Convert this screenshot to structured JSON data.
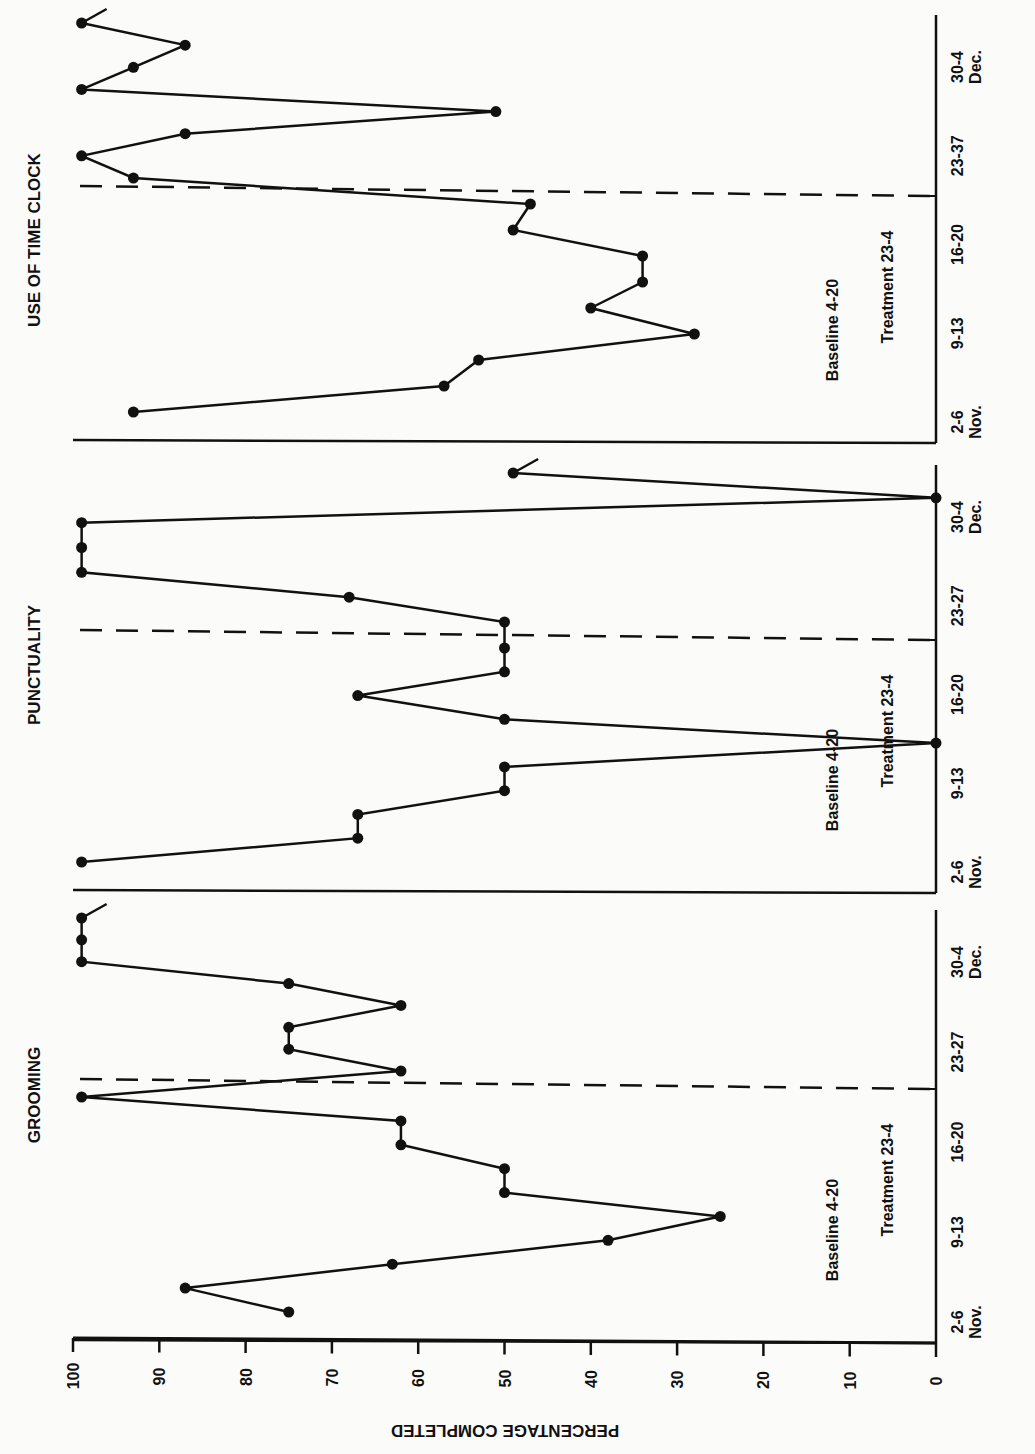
{
  "chart_data": {
    "type": "line",
    "orientation": "rotated-90-clockwise",
    "ylabel": "PERCENTAGE COMPLETED",
    "ylim": [
      0,
      100
    ],
    "yticks": [
      100,
      90,
      80,
      70,
      60,
      50,
      40,
      30,
      20,
      10,
      0
    ],
    "panels": [
      {
        "title": "USE OF TIME CLOCK",
        "xtick_labels": [
          "2-6\nNov.",
          "9-13",
          "16-20",
          "23-37",
          "30-4\nDec."
        ],
        "phase_labels": {
          "baseline": "Baseline 4-20",
          "treatment": "Treatment 23-4"
        },
        "series": [
          {
            "name": "Use of Time Clock",
            "baseline": [
              93,
              57,
              53,
              28,
              40,
              34,
              34,
              49,
              47
            ],
            "treatment": [
              93,
              99,
              87,
              51,
              99,
              93,
              87,
              99
            ]
          }
        ]
      },
      {
        "title": "PUNCTUALITY",
        "xtick_labels": [
          "2-6\nNov.",
          "9-13",
          "16-20",
          "23-27",
          "30-4\nDec."
        ],
        "phase_labels": {
          "baseline": "Baseline 4-20",
          "treatment": "Treatment 23-4"
        },
        "series": [
          {
            "name": "Punctuality",
            "baseline": [
              99,
              67,
              67,
              50,
              50,
              0,
              50,
              67,
              50,
              50
            ],
            "treatment": [
              50,
              68,
              99,
              99,
              99,
              0,
              49
            ]
          }
        ]
      },
      {
        "title": "GROOMING",
        "xtick_labels": [
          "2-6\nNov.",
          "9-13",
          "16-20",
          "23-27",
          "30-4\nDec."
        ],
        "phase_labels": {
          "baseline": "Baseline 4-20",
          "treatment": "Treatment 23-4"
        },
        "series": [
          {
            "name": "Grooming",
            "baseline": [
              75,
              87,
              63,
              38,
              25,
              50,
              50,
              62,
              62,
              99
            ],
            "treatment": [
              62,
              75,
              75,
              62,
              75,
              99,
              99,
              99
            ]
          }
        ]
      }
    ],
    "grid": false,
    "legend": null
  },
  "axis": {
    "ylabel": "PERCENTAGE COMPLETED",
    "ticks": [
      "100",
      "90",
      "80",
      "70",
      "60",
      "50",
      "40",
      "30",
      "20",
      "10",
      "0"
    ]
  },
  "panels": [
    {
      "title": "USE OF TIME CLOCK",
      "baseline_label": "Baseline 4-20",
      "treatment_label": "Treatment 23-4",
      "x_labels": [
        {
          "top": "2-6",
          "bottom": "Nov."
        },
        {
          "top": "9-13",
          "bottom": ""
        },
        {
          "top": "16-20",
          "bottom": ""
        },
        {
          "top": "23-37",
          "bottom": ""
        },
        {
          "top": "30-4",
          "bottom": "Dec."
        }
      ]
    },
    {
      "title": "PUNCTUALITY",
      "baseline_label": "Baseline 4-20",
      "treatment_label": "Treatment 23-4",
      "x_labels": [
        {
          "top": "2-6",
          "bottom": "Nov."
        },
        {
          "top": "9-13",
          "bottom": ""
        },
        {
          "top": "16-20",
          "bottom": ""
        },
        {
          "top": "23-27",
          "bottom": ""
        },
        {
          "top": "30-4",
          "bottom": "Dec."
        }
      ]
    },
    {
      "title": "GROOMING",
      "baseline_label": "Baseline 4-20",
      "treatment_label": "Treatment 23-4",
      "x_labels": [
        {
          "top": "2-6",
          "bottom": "Nov."
        },
        {
          "top": "9-13",
          "bottom": ""
        },
        {
          "top": "16-20",
          "bottom": ""
        },
        {
          "top": "23-27",
          "bottom": ""
        },
        {
          "top": "30-4",
          "bottom": "Dec."
        }
      ]
    }
  ],
  "colors": {
    "ink": "#111111",
    "paper": "#fbfbfa"
  }
}
